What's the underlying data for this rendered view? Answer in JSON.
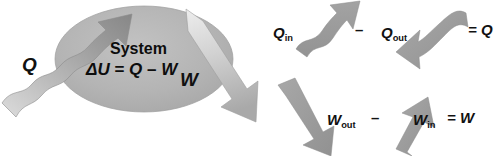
{
  "figure": {
    "background_color": "#ffffff"
  },
  "system": {
    "label": "System",
    "equation_delta": "ΔU",
    "equation_eq": " = ",
    "equation_q": "Q",
    "equation_minus": " – ",
    "equation_w": "W",
    "ellipse_fill": "#b3b3b3",
    "ellipse_edge": "#9a9a9a"
  },
  "arrows": {
    "heat_in": {
      "label": "Q",
      "kind": "wavy-arrow",
      "direction": "up-right",
      "color_light": "#c9c9c9",
      "color_dark": "#8e8e8e"
    },
    "work_out": {
      "label": "W",
      "kind": "straight-arrow",
      "direction": "down-right",
      "color_light": "#e2e2e2",
      "color_dark": "#a7a7a7"
    }
  },
  "equations": {
    "heat": {
      "term1": "Q",
      "term1_sub": "in",
      "operator": "–",
      "term2": "Q",
      "term2_sub": "out",
      "equals": "= Q",
      "arrow1_kind": "wavy-arrow-up-right",
      "arrow2_kind": "wavy-arrow-down-left"
    },
    "work": {
      "term1": "W",
      "term1_sub": "out",
      "operator": "–",
      "term2": "W",
      "term2_sub": "in",
      "equals": "= W",
      "arrow1_kind": "straight-arrow-down-right",
      "arrow2_kind": "straight-arrow-up-left"
    }
  },
  "colors": {
    "arrow_gray": "#9b9b9b",
    "arrow_gray_dark": "#8a8a8a",
    "text": "#111111"
  }
}
